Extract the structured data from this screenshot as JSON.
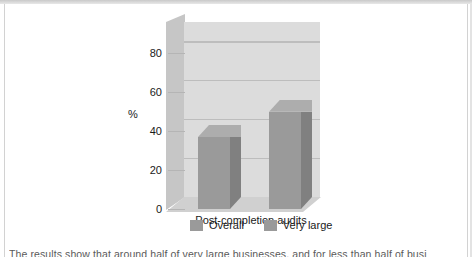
{
  "chart_data": {
    "type": "bar",
    "title": "",
    "subtitle": "",
    "xlabel": "",
    "ylabel": "%",
    "categories": [
      "Post-completion audits"
    ],
    "series": [
      {
        "name": "Overall",
        "values": [
          37
        ],
        "color": "#9a9a9a"
      },
      {
        "name": "Very large",
        "values": [
          50
        ],
        "color": "#9a9a9a"
      }
    ],
    "yticks": [
      0,
      20,
      40,
      60,
      80
    ],
    "ylim": [
      0,
      90
    ],
    "grid": true,
    "legend_position": "bottom",
    "style_3d": true
  },
  "axis": {
    "y_label": "%",
    "tick_labels": [
      "0",
      "20",
      "40",
      "60",
      "80"
    ],
    "category_label": "Post-completion audits"
  },
  "legend": {
    "items": [
      {
        "label": "Overall",
        "color": "#9a9a9a"
      },
      {
        "label": "Very large",
        "color": "#9a9a9a"
      }
    ]
  },
  "caption": {
    "text": "The results show that around half of very large businesses, and for less than half of busi"
  },
  "colors": {
    "page_background": "#ffffff",
    "back_wall": "#dcdcdc",
    "side_wall": "#c6c6c6",
    "floor": "#d0d0d0",
    "gridline": "#bdbdbd",
    "bar_front": "#9a9a9a",
    "bar_side": "#808080",
    "bar_top": "#adadad",
    "text": "#1a1a1a",
    "frame": "#d2d2d2"
  }
}
